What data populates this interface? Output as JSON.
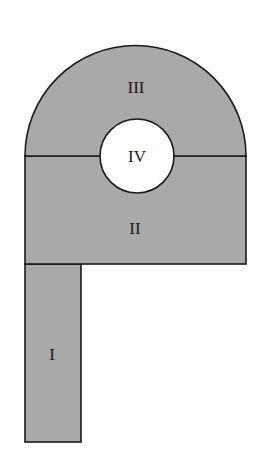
{
  "diagram": {
    "fill_color": "#a9a9a9",
    "hole_color": "#ffffff",
    "stroke_color": "#1a1a1a",
    "regions": [
      {
        "id": "I",
        "label": "I",
        "shape": "rectangle"
      },
      {
        "id": "II",
        "label": "II",
        "shape": "rectangle"
      },
      {
        "id": "III",
        "label": "III",
        "shape": "semicircle"
      },
      {
        "id": "IV",
        "label": "IV",
        "shape": "circle"
      }
    ]
  }
}
